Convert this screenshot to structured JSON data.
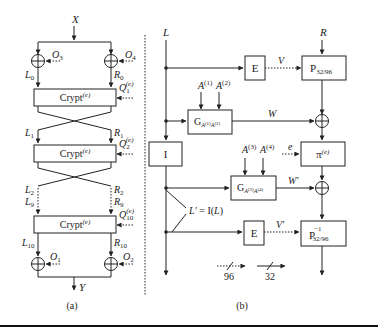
{
  "panel_a": {
    "caption": "(a)",
    "input": "X",
    "output": "Y",
    "crypt_label": "Crypt",
    "crypt_sup": "(e)",
    "xor_top_left": "O3",
    "xor_top_right": "O4",
    "xor_bot_left": "O1",
    "xor_bot_right": "O2",
    "labels": {
      "L0": "L0",
      "R0": "R0",
      "L1": "L1",
      "R1": "R1",
      "L2": "L2",
      "R2": "R2",
      "L9": "L9",
      "R9": "R9",
      "L10": "L10",
      "R10": "R10"
    },
    "q_labels": [
      "Q1",
      "Q2",
      "Q10"
    ],
    "q_sup": "(e)"
  },
  "panel_b": {
    "caption": "(b)",
    "input_left": "L",
    "input_right": "R",
    "box_E1": "E",
    "box_E2": "E",
    "box_I": "I",
    "box_P": "P",
    "box_P_sub": "32/96",
    "box_Pinv": "P",
    "box_Pinv_sup": "−1",
    "box_Pinv_sub": "32/96",
    "box_pi": "π",
    "box_pi_sup": "(e)",
    "box_G1": "G",
    "box_G1_sub": "A(1)A(2)",
    "box_G2": "G",
    "box_G2_sub": "A(3)A(4)",
    "a1": "A",
    "a1_sup": "(1)",
    "a2": "A",
    "a2_sup": "(2)",
    "a3": "A",
    "a3_sup": "(3)",
    "a4": "A",
    "a4_sup": "(4)",
    "e_label": "e",
    "V": "V",
    "W": "W",
    "W_prime": "W′",
    "V_prime": "V′",
    "L_prime_eq": "L′ = I(L)",
    "legend_dotted": "96",
    "legend_solid": "32"
  }
}
